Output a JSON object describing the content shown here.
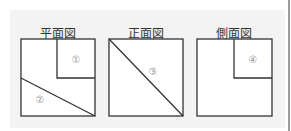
{
  "views": [
    {
      "title": "平面図",
      "labels": [
        "①",
        "②"
      ]
    },
    {
      "title": "正面図",
      "labels": [
        "③"
      ]
    },
    {
      "title": "側面図",
      "labels": [
        "④"
      ]
    }
  ],
  "colors": {
    "panel": "#f3f3f3",
    "line": "#333333",
    "label": "#999999"
  }
}
